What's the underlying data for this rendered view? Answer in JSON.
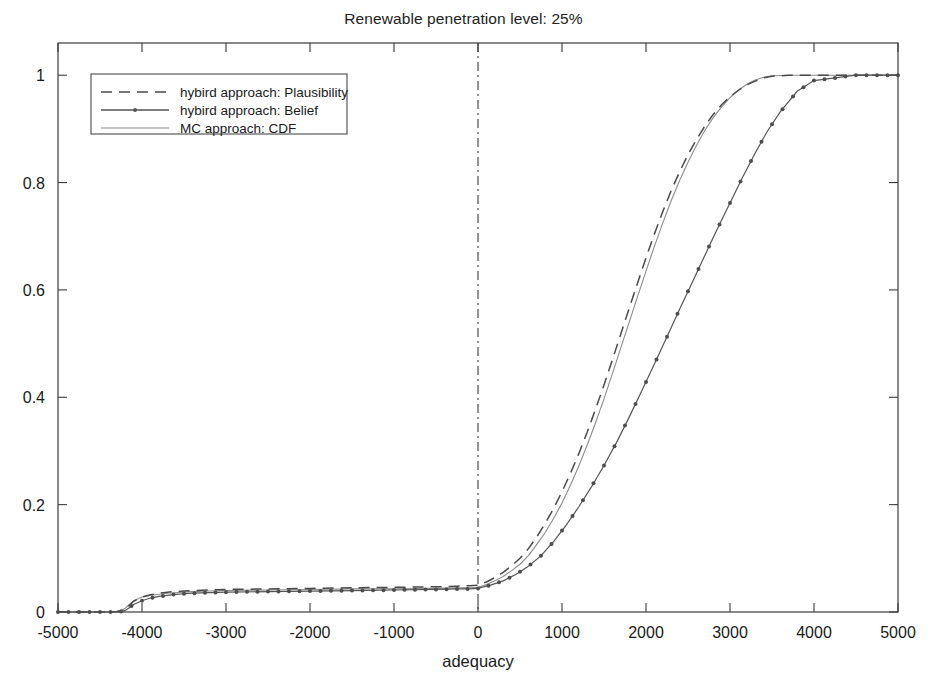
{
  "figure": {
    "background_color": "#ffffff",
    "width": 927,
    "height": 697
  },
  "chart_data": {
    "type": "line",
    "title": "Renewable penetration level: 25%",
    "xlabel": "adequacy",
    "ylabel": "",
    "xlim": [
      -5000,
      5000
    ],
    "ylim": [
      0,
      1.06
    ],
    "grid": false,
    "legend_position": "upper left",
    "xticks": [
      -5000,
      -4000,
      -3000,
      -2000,
      -1000,
      0,
      1000,
      2000,
      3000,
      4000,
      5000
    ],
    "xtick_labels": [
      "-5000",
      "-4000",
      "-3000",
      "-2000",
      "-1000",
      "0",
      "1000",
      "2000",
      "3000",
      "4000",
      "5000"
    ],
    "yticks": [
      0,
      0.2,
      0.4,
      0.6,
      0.8,
      1
    ],
    "ytick_labels": [
      "0",
      "0.2",
      "0.4",
      "0.6",
      "0.8",
      "1"
    ],
    "annotations": [
      {
        "name": "vertical-reference-line",
        "type": "vline",
        "x": 0,
        "style": "dash-dot"
      }
    ],
    "series": [
      {
        "name": "hybird approach: Plausibility",
        "style": "dashed",
        "color": "#4a4a4a",
        "markers": false,
        "x": [
          -5000,
          -4600,
          -4400,
          -4300,
          -4200,
          -4150,
          -4100,
          -4000,
          -3900,
          -3800,
          -3700,
          -3600,
          -3500,
          -3400,
          -3200,
          -3000,
          -2500,
          -2000,
          -1500,
          -1000,
          -500,
          -250,
          -100,
          0,
          100,
          200,
          300,
          400,
          500,
          600,
          700,
          800,
          900,
          1000,
          1100,
          1200,
          1300,
          1400,
          1500,
          1600,
          1700,
          1800,
          1900,
          2000,
          2100,
          2200,
          2300,
          2400,
          2500,
          2600,
          2700,
          2800,
          2900,
          3000,
          3100,
          3200,
          3300,
          3400,
          3500,
          3700,
          4000,
          4500,
          5000
        ],
        "y": [
          0.0,
          0.0,
          0.0,
          0.001,
          0.004,
          0.012,
          0.02,
          0.028,
          0.032,
          0.035,
          0.037,
          0.038,
          0.039,
          0.04,
          0.041,
          0.042,
          0.043,
          0.044,
          0.045,
          0.046,
          0.047,
          0.048,
          0.049,
          0.05,
          0.056,
          0.064,
          0.074,
          0.086,
          0.1,
          0.118,
          0.14,
          0.165,
          0.193,
          0.224,
          0.258,
          0.295,
          0.335,
          0.378,
          0.423,
          0.47,
          0.518,
          0.566,
          0.613,
          0.66,
          0.704,
          0.746,
          0.785,
          0.82,
          0.852,
          0.88,
          0.905,
          0.927,
          0.945,
          0.96,
          0.972,
          0.982,
          0.989,
          0.995,
          0.998,
          1.0,
          1.0,
          1.0,
          1.0
        ]
      },
      {
        "name": "hybird approach: Belief",
        "style": "solid-with-markers",
        "color": "#555555",
        "markers": true,
        "marker_shape": "dot",
        "x": [
          -5000,
          -4750,
          -4500,
          -4400,
          -4300,
          -4250,
          -4200,
          -4150,
          -4100,
          -4000,
          -3900,
          -3800,
          -3700,
          -3600,
          -3500,
          -3400,
          -3200,
          -3000,
          -2500,
          -2000,
          -1500,
          -1000,
          -500,
          -250,
          -100,
          0,
          150,
          300,
          450,
          600,
          750,
          900,
          1050,
          1200,
          1350,
          1500,
          1650,
          1800,
          1950,
          2100,
          2250,
          2400,
          2550,
          2700,
          2850,
          3000,
          3150,
          3300,
          3450,
          3600,
          3800,
          4000,
          4500,
          5000
        ],
        "y": [
          0.0,
          0.0,
          0.0,
          0.0,
          0.0,
          0.001,
          0.003,
          0.008,
          0.014,
          0.021,
          0.026,
          0.029,
          0.031,
          0.033,
          0.034,
          0.035,
          0.036,
          0.037,
          0.038,
          0.039,
          0.04,
          0.041,
          0.042,
          0.043,
          0.043,
          0.044,
          0.05,
          0.058,
          0.07,
          0.085,
          0.105,
          0.131,
          0.162,
          0.196,
          0.233,
          0.273,
          0.316,
          0.363,
          0.412,
          0.462,
          0.513,
          0.564,
          0.614,
          0.664,
          0.714,
          0.762,
          0.81,
          0.855,
          0.897,
          0.932,
          0.97,
          0.99,
          1.0,
          1.0
        ]
      },
      {
        "name": "MC approach: CDF",
        "style": "solid",
        "color": "#8c8c8c",
        "markers": false,
        "x": [
          -5000,
          -4600,
          -4400,
          -4300,
          -4250,
          -4200,
          -4150,
          -4100,
          -4000,
          -3900,
          -3800,
          -3700,
          -3600,
          -3500,
          -3400,
          -3200,
          -3000,
          -2500,
          -2000,
          -1500,
          -1000,
          -500,
          -250,
          -100,
          0,
          100,
          200,
          300,
          400,
          500,
          600,
          700,
          800,
          900,
          1000,
          1100,
          1200,
          1300,
          1400,
          1500,
          1600,
          1700,
          1800,
          1900,
          2000,
          2100,
          2200,
          2300,
          2400,
          2500,
          2600,
          2700,
          2800,
          2900,
          3000,
          3100,
          3200,
          3300,
          3400,
          3500,
          3700,
          4000,
          4500,
          5000
        ],
        "y": [
          0.0,
          0.0,
          0.0,
          0.001,
          0.003,
          0.007,
          0.014,
          0.021,
          0.028,
          0.031,
          0.033,
          0.035,
          0.036,
          0.037,
          0.038,
          0.039,
          0.04,
          0.041,
          0.042,
          0.043,
          0.043,
          0.044,
          0.045,
          0.045,
          0.046,
          0.051,
          0.058,
          0.066,
          0.077,
          0.089,
          0.105,
          0.126,
          0.148,
          0.174,
          0.203,
          0.236,
          0.272,
          0.311,
          0.353,
          0.397,
          0.444,
          0.492,
          0.54,
          0.588,
          0.635,
          0.681,
          0.725,
          0.766,
          0.804,
          0.838,
          0.869,
          0.897,
          0.921,
          0.941,
          0.958,
          0.972,
          0.983,
          0.991,
          0.996,
          0.999,
          1.0,
          1.0,
          1.0,
          1.0
        ]
      }
    ]
  }
}
